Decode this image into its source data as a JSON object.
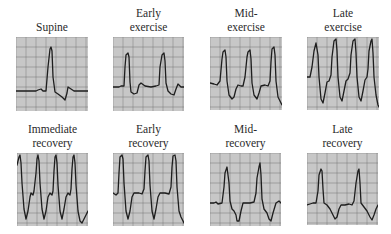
{
  "figure": {
    "background": "#ffffff",
    "grid": {
      "paper_color": "#cfcfcf",
      "minor_color": "#b2b2b2",
      "major_color": "#7a7a7a",
      "minor_step": 2,
      "major_step": 10
    },
    "trace_color": "#1e1e1e",
    "panels": [
      {
        "id": "supine",
        "label_lines": [
          "",
          "Supine"
        ],
        "x": 16,
        "y": 37,
        "w": 72,
        "h": 74,
        "trace": [
          [
            0,
            54
          ],
          [
            20,
            54
          ],
          [
            22,
            53
          ],
          [
            25,
            52
          ],
          [
            27,
            54
          ],
          [
            30,
            54
          ],
          [
            32,
            30
          ],
          [
            34,
            12
          ],
          [
            35,
            10
          ],
          [
            36,
            14
          ],
          [
            37,
            40
          ],
          [
            39,
            55
          ],
          [
            42,
            57
          ],
          [
            46,
            60
          ],
          [
            49,
            63
          ],
          [
            51,
            56
          ],
          [
            52,
            50
          ],
          [
            55,
            52
          ],
          [
            58,
            54
          ],
          [
            72,
            54
          ]
        ]
      },
      {
        "id": "early-exercise",
        "label_lines": [
          "Early",
          "exercise"
        ],
        "x": 113,
        "y": 37,
        "w": 71,
        "h": 74,
        "trace": [
          [
            0,
            50
          ],
          [
            6,
            50
          ],
          [
            8,
            49
          ],
          [
            11,
            49
          ],
          [
            12,
            30
          ],
          [
            13,
            18
          ],
          [
            15,
            16
          ],
          [
            16,
            20
          ],
          [
            17,
            45
          ],
          [
            18,
            55
          ],
          [
            21,
            57
          ],
          [
            24,
            56
          ],
          [
            26,
            48
          ],
          [
            28,
            46
          ],
          [
            32,
            49
          ],
          [
            38,
            50
          ],
          [
            43,
            49
          ],
          [
            46,
            48
          ],
          [
            47,
            30
          ],
          [
            49,
            18
          ],
          [
            51,
            16
          ],
          [
            52,
            24
          ],
          [
            53,
            46
          ],
          [
            55,
            54
          ],
          [
            58,
            57
          ],
          [
            61,
            58
          ],
          [
            63,
            52
          ],
          [
            65,
            47
          ],
          [
            68,
            50
          ],
          [
            71,
            50
          ]
        ]
      },
      {
        "id": "mid-exercise",
        "label_lines": [
          "Mid-",
          "exercise"
        ],
        "x": 210,
        "y": 37,
        "w": 72,
        "h": 73,
        "trace": [
          [
            0,
            46
          ],
          [
            4,
            47
          ],
          [
            7,
            48
          ],
          [
            10,
            44
          ],
          [
            12,
            22
          ],
          [
            13,
            15
          ],
          [
            15,
            13
          ],
          [
            16,
            20
          ],
          [
            17,
            44
          ],
          [
            19,
            58
          ],
          [
            22,
            62
          ],
          [
            24,
            60
          ],
          [
            26,
            52
          ],
          [
            28,
            48
          ],
          [
            31,
            49
          ],
          [
            33,
            49
          ],
          [
            35,
            40
          ],
          [
            37,
            20
          ],
          [
            38,
            15
          ],
          [
            40,
            13
          ],
          [
            41,
            22
          ],
          [
            42,
            46
          ],
          [
            44,
            58
          ],
          [
            47,
            62
          ],
          [
            49,
            56
          ],
          [
            51,
            49
          ],
          [
            55,
            48
          ],
          [
            58,
            49
          ],
          [
            60,
            44
          ],
          [
            61,
            25
          ],
          [
            62,
            12
          ],
          [
            64,
            10
          ],
          [
            65,
            18
          ],
          [
            66,
            44
          ],
          [
            68,
            60
          ],
          [
            71,
            66
          ],
          [
            72,
            68
          ]
        ]
      },
      {
        "id": "late-exercise",
        "label_lines": [
          "Late",
          "exercise"
        ],
        "x": 307,
        "y": 37,
        "w": 72,
        "h": 73,
        "trace": [
          [
            0,
            40
          ],
          [
            3,
            40
          ],
          [
            5,
            30
          ],
          [
            7,
            14
          ],
          [
            9,
            6
          ],
          [
            11,
            18
          ],
          [
            12,
            40
          ],
          [
            14,
            62
          ],
          [
            16,
            66
          ],
          [
            18,
            56
          ],
          [
            20,
            45
          ],
          [
            22,
            44
          ],
          [
            24,
            38
          ],
          [
            25,
            20
          ],
          [
            27,
            4
          ],
          [
            29,
            2
          ],
          [
            30,
            14
          ],
          [
            31,
            40
          ],
          [
            33,
            60
          ],
          [
            35,
            64
          ],
          [
            37,
            54
          ],
          [
            39,
            44
          ],
          [
            41,
            42
          ],
          [
            43,
            36
          ],
          [
            44,
            18
          ],
          [
            46,
            4
          ],
          [
            48,
            2
          ],
          [
            49,
            16
          ],
          [
            50,
            40
          ],
          [
            52,
            60
          ],
          [
            54,
            64
          ],
          [
            56,
            54
          ],
          [
            58,
            43
          ],
          [
            60,
            40
          ],
          [
            61,
            32
          ],
          [
            62,
            14
          ],
          [
            64,
            4
          ],
          [
            65,
            2
          ],
          [
            66,
            16
          ],
          [
            67,
            40
          ],
          [
            69,
            58
          ],
          [
            71,
            68
          ],
          [
            72,
            70
          ]
        ]
      },
      {
        "id": "immediate-recovery",
        "label_lines": [
          "Immediate",
          "recovery"
        ],
        "x": 17,
        "y": 153,
        "w": 71,
        "h": 73,
        "trace": [
          [
            0,
            12
          ],
          [
            2,
            4
          ],
          [
            3,
            2
          ],
          [
            4,
            10
          ],
          [
            5,
            30
          ],
          [
            7,
            56
          ],
          [
            9,
            66
          ],
          [
            11,
            58
          ],
          [
            13,
            44
          ],
          [
            14,
            40
          ],
          [
            16,
            42
          ],
          [
            17,
            38
          ],
          [
            19,
            20
          ],
          [
            20,
            6
          ],
          [
            21,
            2
          ],
          [
            22,
            8
          ],
          [
            23,
            30
          ],
          [
            25,
            56
          ],
          [
            27,
            66
          ],
          [
            29,
            58
          ],
          [
            31,
            44
          ],
          [
            33,
            40
          ],
          [
            35,
            42
          ],
          [
            36,
            38
          ],
          [
            37,
            18
          ],
          [
            38,
            4
          ],
          [
            39,
            2
          ],
          [
            40,
            10
          ],
          [
            41,
            32
          ],
          [
            43,
            58
          ],
          [
            45,
            66
          ],
          [
            47,
            56
          ],
          [
            49,
            44
          ],
          [
            51,
            40
          ],
          [
            53,
            42
          ],
          [
            54,
            36
          ],
          [
            55,
            16
          ],
          [
            56,
            4
          ],
          [
            57,
            2
          ],
          [
            58,
            10
          ],
          [
            59,
            32
          ],
          [
            61,
            58
          ],
          [
            63,
            68
          ],
          [
            65,
            70
          ],
          [
            67,
            66
          ],
          [
            69,
            62
          ],
          [
            71,
            58
          ]
        ]
      },
      {
        "id": "early-recovery",
        "label_lines": [
          "Early",
          "recovery"
        ],
        "x": 113,
        "y": 153,
        "w": 71,
        "h": 73,
        "trace": [
          [
            0,
            40
          ],
          [
            3,
            42
          ],
          [
            5,
            40
          ],
          [
            6,
            20
          ],
          [
            7,
            4
          ],
          [
            9,
            2
          ],
          [
            10,
            6
          ],
          [
            11,
            30
          ],
          [
            13,
            58
          ],
          [
            15,
            66
          ],
          [
            17,
            58
          ],
          [
            19,
            44
          ],
          [
            21,
            40
          ],
          [
            26,
            40
          ],
          [
            29,
            41
          ],
          [
            31,
            36
          ],
          [
            32,
            18
          ],
          [
            33,
            4
          ],
          [
            35,
            2
          ],
          [
            36,
            8
          ],
          [
            37,
            32
          ],
          [
            39,
            58
          ],
          [
            41,
            66
          ],
          [
            43,
            56
          ],
          [
            45,
            44
          ],
          [
            47,
            40
          ],
          [
            52,
            40
          ],
          [
            56,
            41
          ],
          [
            58,
            34
          ],
          [
            59,
            14
          ],
          [
            60,
            3
          ],
          [
            62,
            2
          ],
          [
            63,
            8
          ],
          [
            64,
            34
          ],
          [
            66,
            58
          ],
          [
            68,
            64
          ],
          [
            71,
            70
          ]
        ]
      },
      {
        "id": "mid-recovery",
        "label_lines": [
          "Mid-",
          "recovery"
        ],
        "x": 210,
        "y": 153,
        "w": 71,
        "h": 73,
        "trace": [
          [
            0,
            50
          ],
          [
            4,
            50
          ],
          [
            6,
            49
          ],
          [
            8,
            51
          ],
          [
            12,
            50
          ],
          [
            14,
            34
          ],
          [
            15,
            20
          ],
          [
            17,
            14
          ],
          [
            19,
            30
          ],
          [
            20,
            48
          ],
          [
            22,
            56
          ],
          [
            24,
            58
          ],
          [
            26,
            62
          ],
          [
            27,
            68
          ],
          [
            29,
            68
          ],
          [
            31,
            58
          ],
          [
            33,
            50
          ],
          [
            37,
            50
          ],
          [
            40,
            50
          ],
          [
            44,
            49
          ],
          [
            46,
            40
          ],
          [
            47,
            25
          ],
          [
            49,
            14
          ],
          [
            50,
            10
          ],
          [
            51,
            22
          ],
          [
            52,
            46
          ],
          [
            54,
            56
          ],
          [
            57,
            60
          ],
          [
            59,
            66
          ],
          [
            61,
            68
          ],
          [
            63,
            60
          ],
          [
            66,
            50
          ],
          [
            69,
            48
          ],
          [
            71,
            50
          ]
        ]
      },
      {
        "id": "late-recovery",
        "label_lines": [
          "Late",
          "recovery"
        ],
        "x": 307,
        "y": 153,
        "w": 71,
        "h": 72,
        "trace": [
          [
            0,
            52
          ],
          [
            3,
            51
          ],
          [
            6,
            50
          ],
          [
            9,
            50
          ],
          [
            11,
            38
          ],
          [
            12,
            22
          ],
          [
            14,
            16
          ],
          [
            15,
            18
          ],
          [
            16,
            36
          ],
          [
            17,
            50
          ],
          [
            20,
            52
          ],
          [
            23,
            56
          ],
          [
            26,
            62
          ],
          [
            28,
            66
          ],
          [
            30,
            64
          ],
          [
            32,
            56
          ],
          [
            34,
            52
          ],
          [
            38,
            52
          ],
          [
            42,
            51
          ],
          [
            45,
            52
          ],
          [
            47,
            48
          ],
          [
            49,
            30
          ],
          [
            51,
            18
          ],
          [
            52,
            16
          ],
          [
            53,
            30
          ],
          [
            54,
            50
          ],
          [
            57,
            54
          ],
          [
            60,
            58
          ],
          [
            63,
            64
          ],
          [
            65,
            67
          ],
          [
            67,
            62
          ],
          [
            69,
            56
          ],
          [
            71,
            52
          ]
        ]
      }
    ]
  }
}
